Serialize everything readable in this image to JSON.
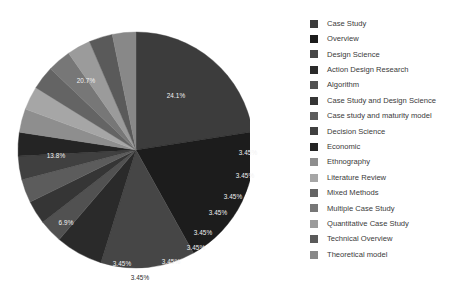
{
  "chart_data": {
    "type": "pie",
    "title": "",
    "legend_position": "right",
    "total_count": 29,
    "categories": [
      "Case Study",
      "Overview",
      "Design Science",
      "Action  Design Research",
      "Algorithm",
      "Case Study and Design Science",
      "Case study and maturity model",
      "Decision Science",
      "Economic",
      "Ethnography",
      "Literature Review",
      "Mixed Methods",
      "Multiple Case Study",
      "Quantitative Case Study",
      "Technical Overview",
      "Theoretical model"
    ],
    "values": [
      24.1,
      20.7,
      13.8,
      6.9,
      3.45,
      3.45,
      3.45,
      3.45,
      3.45,
      3.45,
      3.45,
      3.45,
      3.45,
      3.45,
      3.45,
      3.45
    ],
    "colors": [
      "#3c3c3c",
      "#1c1c1c",
      "#464646",
      "#2a2a2a",
      "#515151",
      "#353535",
      "#5c5c5c",
      "#404040",
      "#242424",
      "#8e8e8e",
      "#a6a6a6",
      "#646464",
      "#777777",
      "#9b9b9b",
      "#5a5a5a",
      "#888888"
    ],
    "slice_labels": [
      {
        "text": "24.1%",
        "x": 176,
        "y": 95,
        "tone": "light"
      },
      {
        "text": "20.7%",
        "x": 86,
        "y": 80,
        "tone": "light"
      },
      {
        "text": "13.8%",
        "x": 56,
        "y": 155,
        "tone": "light"
      },
      {
        "text": "6.9%",
        "x": 66,
        "y": 222,
        "tone": "light"
      },
      {
        "text": "3.45%",
        "x": 140,
        "y": 277,
        "tone": "dark"
      },
      {
        "text": "3.45%",
        "x": 122,
        "y": 263,
        "tone": "light"
      },
      {
        "text": "3.45%",
        "x": 171,
        "y": 261,
        "tone": "light"
      },
      {
        "text": "3.45%",
        "x": 196,
        "y": 247,
        "tone": "light"
      },
      {
        "text": "3.45%",
        "x": 203,
        "y": 232,
        "tone": "light"
      },
      {
        "text": "3.45%",
        "x": 218,
        "y": 212,
        "tone": "light"
      },
      {
        "text": "3.45%",
        "x": 233,
        "y": 196,
        "tone": "light"
      },
      {
        "text": "3.45%",
        "x": 245,
        "y": 175,
        "tone": "light"
      },
      {
        "text": "3.45%",
        "x": 248,
        "y": 152,
        "tone": "light"
      }
    ],
    "geometry": {
      "cx": 136,
      "cy": 150,
      "r": 118,
      "start_angle_deg": -90
    }
  },
  "legend": {
    "items": [
      {
        "label": "Case Study",
        "color": "#3c3c3c"
      },
      {
        "label": "Overview",
        "color": "#1c1c1c"
      },
      {
        "label": "Design Science",
        "color": "#464646"
      },
      {
        "label": "Action  Design Research",
        "color": "#2a2a2a"
      },
      {
        "label": "Algorithm",
        "color": "#515151"
      },
      {
        "label": "Case Study and Design Science",
        "color": "#353535"
      },
      {
        "label": "Case study and maturity model",
        "color": "#5c5c5c"
      },
      {
        "label": "Decision Science",
        "color": "#404040"
      },
      {
        "label": "Economic",
        "color": "#242424"
      },
      {
        "label": "Ethnography",
        "color": "#8e8e8e"
      },
      {
        "label": "Literature Review",
        "color": "#a6a6a6"
      },
      {
        "label": "Mixed Methods",
        "color": "#646464"
      },
      {
        "label": "Multiple Case Study",
        "color": "#777777"
      },
      {
        "label": "Quantitative Case Study",
        "color": "#9b9b9b"
      },
      {
        "label": "Technical Overview",
        "color": "#5a5a5a"
      },
      {
        "label": "Theoretical model",
        "color": "#888888"
      }
    ]
  }
}
